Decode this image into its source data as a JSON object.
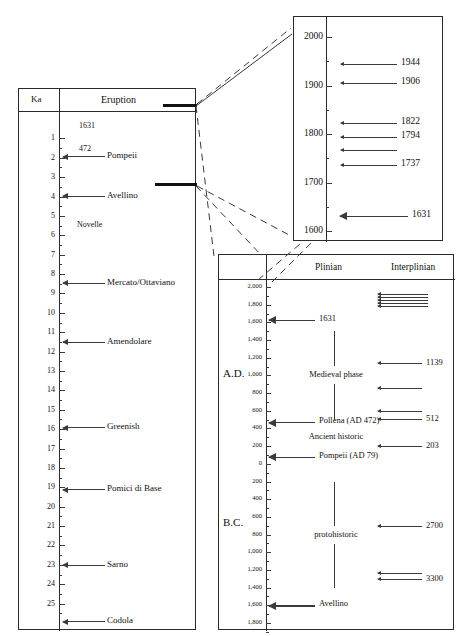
{
  "figure": {
    "type": "volcanic-eruption-chronology",
    "panels": [
      "left-ka-column",
      "top-right-historical",
      "bottom-right-plinian-interplinian"
    ]
  },
  "left_panel": {
    "header_age": "Ka",
    "header_eruption": "Eruption",
    "axis": {
      "unit": "Ka",
      "min": 0,
      "max": 26,
      "ticks": [
        1,
        2,
        3,
        4,
        5,
        6,
        7,
        8,
        9,
        10,
        11,
        12,
        13,
        14,
        15,
        16,
        17,
        18,
        19,
        20,
        21,
        22,
        23,
        24,
        25
      ]
    },
    "tick_labels": [
      "1",
      "2",
      "3",
      "4",
      "5",
      "6",
      "7",
      "8",
      "9",
      "10",
      "11",
      "12",
      "13",
      "14",
      "15",
      "16",
      "17",
      "18",
      "19",
      "20",
      "21",
      "22",
      "23",
      "24",
      "25"
    ],
    "plain_labels": [
      {
        "text": "1631",
        "ka": 0.37
      },
      {
        "text": "472",
        "ka": 1.53
      },
      {
        "text": "Novelle",
        "ka": 5.45
      }
    ],
    "events": [
      {
        "name": "Pompeii",
        "ka": 1.93
      },
      {
        "name": "Avellino",
        "ka": 3.95
      },
      {
        "name": "Mercato/Ottaviano",
        "ka": 8.45
      },
      {
        "name": "Amendolare",
        "ka": 11.5
      },
      {
        "name": "Greenish",
        "ka": 15.9
      },
      {
        "name": "Pomici di Base",
        "ka": 19.1
      },
      {
        "name": "Sarno",
        "ka": 23.0
      },
      {
        "name": "Codola",
        "ka": 25.9
      }
    ]
  },
  "top_right_panel": {
    "axis": {
      "unit": "year AD",
      "min": 1600,
      "max": 2000,
      "ticks": [
        1600,
        1700,
        1800,
        1900,
        2000
      ],
      "minor_step": 50
    },
    "tick_labels": [
      "2000",
      "1900",
      "1800",
      "1700",
      "1600"
    ],
    "eruptions": [
      {
        "year": "1944",
        "value": 1944,
        "labeled": true
      },
      {
        "year": "1906",
        "value": 1906,
        "labeled": true
      },
      {
        "year": "1822",
        "value": 1822,
        "labeled": true
      },
      {
        "year": "1794",
        "value": 1794,
        "labeled": true
      },
      {
        "year": "",
        "value": 1767,
        "labeled": false
      },
      {
        "year": "1737",
        "value": 1737,
        "labeled": true
      },
      {
        "year": "1631",
        "value": 1631,
        "labeled": true,
        "emphasis": true
      }
    ]
  },
  "bottom_right_panel": {
    "header_plinian": "Plinian",
    "header_interplinian": "Interplinian",
    "era_ad": "A.D.",
    "era_bc": "B.C.",
    "axis": {
      "unit": "year",
      "top_value": 2000,
      "bottom_value": -1800,
      "step": 200,
      "labels": [
        "2,000",
        "1,800",
        "1,600",
        "1,400",
        "1,200",
        "1,000",
        "800",
        "600",
        "400",
        "200",
        "0",
        "200",
        "400",
        "600",
        "800",
        "1,000",
        "1,200",
        "1,400",
        "1,600",
        "1,800"
      ]
    },
    "plinian_events": [
      {
        "name": "1631",
        "value": 1631
      },
      {
        "name": "Pollena (AD 472)",
        "value": 472
      },
      {
        "name": "Pompeii (AD 79)",
        "value": 79
      },
      {
        "name": "Avellino",
        "value": -1600
      }
    ],
    "plinian_phases": [
      {
        "name": "Medieval phase",
        "from": 1500,
        "to": 500
      },
      {
        "name": "Ancient  historic",
        "from": 300,
        "to": 300,
        "no_bracket": true
      },
      {
        "name": "protohistoric",
        "from": -200,
        "to": -1400
      }
    ],
    "interplinian_events": [
      {
        "label": "",
        "value": 1850,
        "cluster": true,
        "count": 5
      },
      {
        "label": "1139",
        "value": 1139
      },
      {
        "label": "",
        "value": 860
      },
      {
        "label": "",
        "value": 600
      },
      {
        "label": "512",
        "value": 512
      },
      {
        "label": "203",
        "value": 203
      },
      {
        "label": "2700",
        "value": -700
      },
      {
        "label": "",
        "value": -1230
      },
      {
        "label": "3300",
        "value": -1300
      }
    ]
  }
}
